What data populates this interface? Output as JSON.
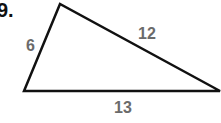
{
  "problem": {
    "number": "9."
  },
  "triangle": {
    "sides": [
      {
        "name": "left",
        "label": "6"
      },
      {
        "name": "top-right",
        "label": "12"
      },
      {
        "name": "bottom",
        "label": "13"
      }
    ],
    "stroke_color": "#111111",
    "label_color": "#6b6b6b"
  }
}
